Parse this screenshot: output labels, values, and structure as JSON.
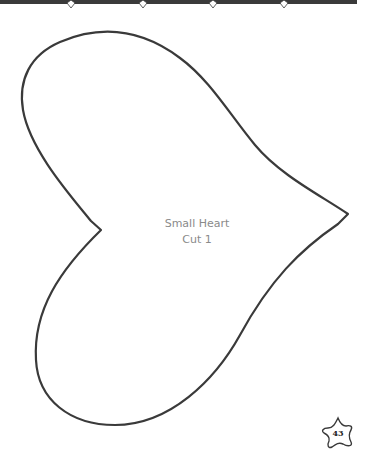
{
  "page": {
    "label_line1": "Small Heart",
    "label_line2": "Cut 1",
    "page_number": "43"
  },
  "colors": {
    "outline": "#3a3a3a",
    "label_text": "#8a8a8a",
    "top_bar": "#3a3a3a"
  },
  "decor": {
    "top_bar_diamond_positions": [
      71,
      143,
      213,
      284
    ]
  }
}
